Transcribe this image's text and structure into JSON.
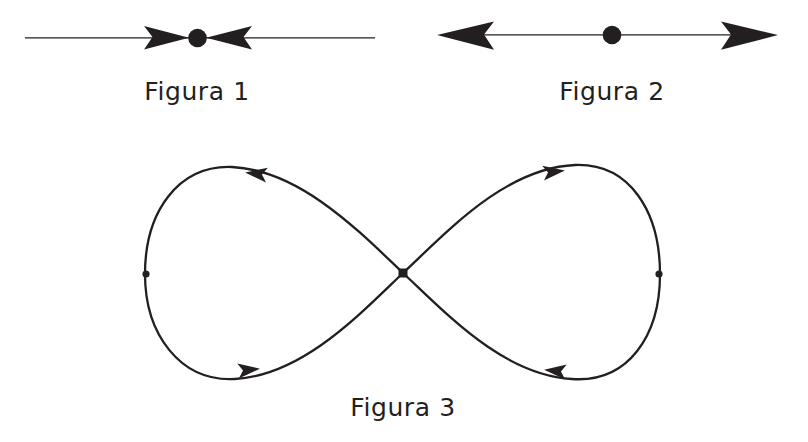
{
  "page": {
    "background_color": "#ffffff",
    "ink_color": "#231f20",
    "width": 808,
    "height": 442
  },
  "figures": [
    {
      "id": "figura-1",
      "caption": "Figura 1",
      "kind": "phase-line",
      "stability": "attracting",
      "axis": {
        "x1": 25,
        "x2": 375,
        "y": 38
      },
      "equilibrium_point": {
        "cx": 197,
        "cy": 38,
        "r": 9
      },
      "arrows": [
        {
          "name": "arrow-left-inward",
          "direction": "right",
          "tip_x": 197,
          "y": 38
        },
        {
          "name": "arrow-right-inward",
          "direction": "left",
          "tip_x": 197,
          "y": 38
        }
      ]
    },
    {
      "id": "figura-2",
      "caption": "Figura 2",
      "kind": "phase-line",
      "stability": "repelling",
      "axis": {
        "x1": 440,
        "x2": 775,
        "y": 35
      },
      "equilibrium_point": {
        "cx": 612,
        "cy": 35,
        "r": 9
      },
      "arrows": [
        {
          "name": "arrow-left-outward",
          "direction": "left",
          "tip_x": 440,
          "y": 35
        },
        {
          "name": "arrow-right-outward",
          "direction": "right",
          "tip_x": 775,
          "y": 35
        }
      ]
    },
    {
      "id": "figura-3",
      "caption": "Figura 3",
      "kind": "lemniscate",
      "bounds": {
        "left": 145,
        "right": 660,
        "top": 162,
        "bottom": 383
      },
      "crossing_node": {
        "cx": 403,
        "cy": 273,
        "size": 9,
        "shape": "square"
      },
      "loop_points": [
        {
          "name": "left-loop-point",
          "cx": 146,
          "cy": 274,
          "r": 3.5
        },
        {
          "name": "right-loop-point",
          "cx": 659,
          "cy": 274,
          "r": 3.5
        }
      ],
      "arrows": [
        {
          "name": "arrow-top-left",
          "direction": "left",
          "x": 258,
          "y": 174
        },
        {
          "name": "arrow-top-right",
          "direction": "right",
          "x": 552,
          "y": 172
        },
        {
          "name": "arrow-bottom-left",
          "direction": "right",
          "x": 247,
          "y": 370
        },
        {
          "name": "arrow-bottom-right",
          "direction": "left",
          "x": 557,
          "y": 371
        }
      ]
    }
  ]
}
